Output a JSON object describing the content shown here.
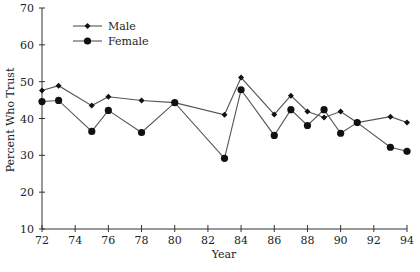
{
  "chart_data": {
    "type": "line",
    "title": "",
    "xlabel": "Year",
    "ylabel": "Percent Who Trust",
    "xlim": [
      72,
      94
    ],
    "ylim": [
      10,
      70
    ],
    "xticks": [
      72,
      74,
      76,
      78,
      80,
      82,
      84,
      86,
      88,
      90,
      92,
      94
    ],
    "yticks": [
      10,
      20,
      30,
      40,
      50,
      60,
      70
    ],
    "grid": false,
    "legend_position": "upper-left",
    "series": [
      {
        "name": "Male",
        "marker": "diamond",
        "x": [
          72,
          73,
          75,
          76,
          78,
          80,
          83,
          84,
          86,
          87,
          88,
          89,
          90,
          91,
          93,
          94
        ],
        "values": [
          47.6,
          48.9,
          43.5,
          45.9,
          44.9,
          44.3,
          41.0,
          51.1,
          41.1,
          46.2,
          41.9,
          40.3,
          41.9,
          38.9,
          40.5,
          38.9
        ]
      },
      {
        "name": "Female",
        "marker": "circle",
        "x": [
          72,
          73,
          75,
          76,
          78,
          80,
          83,
          84,
          86,
          87,
          88,
          89,
          90,
          91,
          93,
          94
        ],
        "values": [
          44.6,
          44.9,
          36.5,
          42.2,
          36.2,
          44.3,
          29.2,
          47.8,
          35.4,
          42.4,
          38.1,
          42.4,
          36.0,
          38.9,
          32.2,
          31.1
        ]
      }
    ]
  }
}
